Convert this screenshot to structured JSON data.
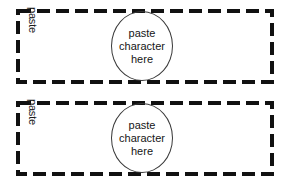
{
  "document": {
    "title": "paste character template",
    "background_color": "#ffffff",
    "ink_color": "#000000",
    "border_style": "dashed",
    "border_color": "#111111"
  },
  "cards": [
    {
      "id": "card-1",
      "side_label": "paste",
      "dropzone": {
        "shape": "ellipse",
        "outline_color": "#3a3a3a",
        "lines": [
          "paste",
          "character",
          "here"
        ]
      }
    },
    {
      "id": "card-2",
      "side_label": "paste",
      "dropzone": {
        "shape": "ellipse",
        "outline_color": "#3a3a3a",
        "lines": [
          "paste",
          "character",
          "here"
        ]
      }
    }
  ]
}
